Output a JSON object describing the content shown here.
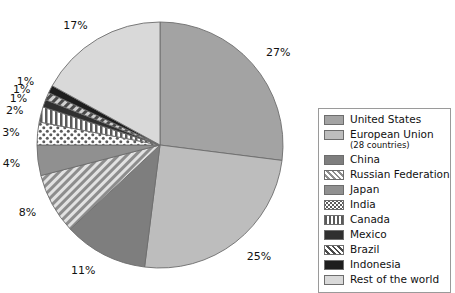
{
  "chart_data": {
    "type": "pie",
    "title": "",
    "start_angle_deg": 0,
    "direction": "clockwise",
    "unit": "%",
    "categories": [
      "United States",
      "European Union (28 countries)",
      "China",
      "Russian Federation",
      "Japan",
      "India",
      "Canada",
      "Mexico",
      "Brazil",
      "Indonesia",
      "Rest of the world"
    ],
    "values": [
      27,
      25,
      11,
      8,
      4,
      3,
      2,
      1,
      1,
      1,
      17
    ],
    "data_labels": [
      "27%",
      "25%",
      "11%",
      "8%",
      "4%",
      "3%",
      "2%",
      "1%",
      "1%",
      "1%",
      "17%"
    ],
    "total": 100,
    "legend_position": "right",
    "grid": false
  },
  "slices": [
    {
      "key": "united-states",
      "label": "United States",
      "value": 27,
      "label_text": "27%",
      "fill": "#a3a3a3",
      "pattern": "solid"
    },
    {
      "key": "european-union",
      "label": "European Union",
      "value": 25,
      "label_text": "25%",
      "fill": "#bdbdbd",
      "pattern": "solid"
    },
    {
      "key": "china",
      "label": "China",
      "value": 11,
      "label_text": "11%",
      "fill": "#7e7e7e",
      "pattern": "solid"
    },
    {
      "key": "russian-federation",
      "label": "Russian Federation",
      "value": 8,
      "label_text": "8%",
      "fill": "#c7c7c7",
      "pattern": "diagonal-stripes"
    },
    {
      "key": "japan",
      "label": "Japan",
      "value": 4,
      "label_text": "4%",
      "fill": "#909090",
      "pattern": "solid"
    },
    {
      "key": "india",
      "label": "India",
      "value": 3,
      "label_text": "3%",
      "fill": "#ffffff",
      "pattern": "dots"
    },
    {
      "key": "canada",
      "label": "Canada",
      "value": 2,
      "label_text": "2%",
      "fill": "#ffffff",
      "pattern": "vertical-stripes"
    },
    {
      "key": "mexico",
      "label": "Mexico",
      "value": 1,
      "label_text": "1%",
      "fill": "#303030",
      "pattern": "solid"
    },
    {
      "key": "brazil",
      "label": "Brazil",
      "value": 1,
      "label_text": "1%",
      "fill": "#9a9a9a",
      "pattern": "diagonal-stripes-dark"
    },
    {
      "key": "indonesia",
      "label": "Indonesia",
      "value": 1,
      "label_text": "1%",
      "fill": "#1e1e1e",
      "pattern": "solid"
    },
    {
      "key": "rest-of-the-world",
      "label": "Rest of the world",
      "value": 17,
      "label_text": "17%",
      "fill": "#d9d9d9",
      "pattern": "solid"
    }
  ],
  "legend": {
    "items": [
      {
        "key": "united-states",
        "label": "United States",
        "sublabel": ""
      },
      {
        "key": "european-union",
        "label": "European Union",
        "sublabel": "(28 countries)"
      },
      {
        "key": "china",
        "label": "China",
        "sublabel": ""
      },
      {
        "key": "russian-federation",
        "label": "Russian Federation",
        "sublabel": ""
      },
      {
        "key": "japan",
        "label": "Japan",
        "sublabel": ""
      },
      {
        "key": "india",
        "label": "India",
        "sublabel": ""
      },
      {
        "key": "canada",
        "label": "Canada",
        "sublabel": ""
      },
      {
        "key": "mexico",
        "label": "Mexico",
        "sublabel": ""
      },
      {
        "key": "brazil",
        "label": "Brazil",
        "sublabel": ""
      },
      {
        "key": "indonesia",
        "label": "Indonesia",
        "sublabel": ""
      },
      {
        "key": "rest-of-the-world",
        "label": "Rest of the world",
        "sublabel": ""
      }
    ]
  },
  "geometry": {
    "center_x": 160,
    "center_y": 145,
    "radius": 123,
    "label_radius": 140
  },
  "colors": {
    "background": "#ffffff",
    "slice_outline": "#6d6d6d",
    "legend_border": "#9a9a9a",
    "text": "#111111"
  }
}
